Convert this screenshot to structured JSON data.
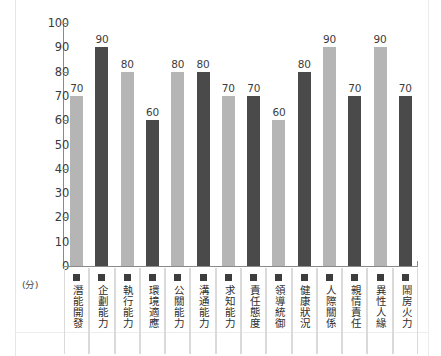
{
  "chart_data": {
    "type": "bar",
    "title": "",
    "xlabel": "",
    "ylabel": "(分)",
    "ylim": [
      0,
      100
    ],
    "y_ticks": [
      100,
      90,
      80,
      70,
      60,
      50,
      40,
      30,
      20,
      10,
      0
    ],
    "grid": false,
    "legend": "none",
    "categories": [
      "潛能開發",
      "企劃能力",
      "執行能力",
      "環境適應",
      "公關能力",
      "溝通能力",
      "求知能力",
      "責任態度",
      "領導統御",
      "健康狀況",
      "人際關係",
      "親情責任",
      "異性人緣",
      "鬧房火力"
    ],
    "values": [
      70,
      90,
      80,
      60,
      80,
      80,
      70,
      70,
      60,
      80,
      90,
      70,
      90,
      70
    ],
    "bar_colors": [
      "light",
      "dark",
      "light",
      "dark",
      "light",
      "dark",
      "light",
      "dark",
      "light",
      "dark",
      "light",
      "dark",
      "light",
      "dark"
    ],
    "colors": {
      "light_bar": "#b5b5b5",
      "dark_bar": "#4a4a4a",
      "axis": "#8a8a8a",
      "text": "#2e2e2e",
      "background": "#ffffff",
      "marker": "#3d3d3d",
      "separator": "#dadada"
    }
  }
}
